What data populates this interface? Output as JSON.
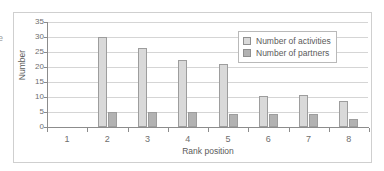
{
  "margin_fragment": "e",
  "chart_data": {
    "type": "bar",
    "title": "",
    "xlabel": "Rank position",
    "ylabel": "Number",
    "categories": [
      "1",
      "2",
      "3",
      "4",
      "5",
      "6",
      "7",
      "8"
    ],
    "ylim": [
      0,
      35
    ],
    "ytick_values": [
      "0",
      "5",
      "10",
      "15",
      "20",
      "25",
      "30",
      "35"
    ],
    "grid": true,
    "legend_position": "top-right",
    "series": [
      {
        "name": "Number of activities",
        "color": "#d9d9d9",
        "values": [
          0,
          30,
          26.3,
          22.4,
          21,
          10.2,
          10.8,
          8.7
        ]
      },
      {
        "name": "Number of partners",
        "color": "#b2b2b2",
        "values": [
          0,
          5,
          5,
          5,
          4.5,
          4.4,
          4.5,
          2.6
        ]
      }
    ]
  }
}
